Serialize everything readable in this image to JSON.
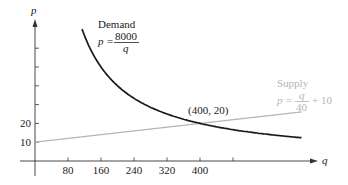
{
  "chart_data": {
    "type": "line",
    "title": "",
    "xlabel": "q",
    "ylabel": "p",
    "x_ticks": [
      80,
      160,
      240,
      320,
      400,
      480
    ],
    "x_tick_labels": [
      "80",
      "160",
      "240",
      "320",
      "400"
    ],
    "y_ticks": [
      10,
      20,
      30,
      40,
      50,
      60
    ],
    "y_tick_labels": [
      "10",
      "20"
    ],
    "xlim": [
      0,
      700
    ],
    "ylim": [
      0,
      75
    ],
    "grid": false,
    "series": [
      {
        "name": "Demand",
        "equation": "p = 8000/q",
        "label_line1": "Demand",
        "label_lhs": "p =",
        "label_num": "8000",
        "label_den": "q",
        "color": "#1a1a1a",
        "q_range": [
          114,
          647
        ],
        "x": [
          114,
          150,
          200,
          250,
          300,
          350,
          400,
          450,
          500,
          550,
          600,
          647
        ],
        "values": [
          70.2,
          53.3,
          40,
          32,
          26.7,
          22.9,
          20,
          17.8,
          16,
          14.5,
          13.3,
          12.4
        ]
      },
      {
        "name": "Supply",
        "equation": "p = q/40 + 10",
        "label_line1": "Supply",
        "label_lhs": "p =",
        "label_num": "q",
        "label_den": "40",
        "label_tail": "+ 10",
        "color": "#b5b5b5",
        "q_range": [
          0,
          647
        ],
        "x": [
          0,
          647
        ],
        "values": [
          10,
          26.2
        ]
      }
    ],
    "annotations": [
      {
        "text": "(400, 20)",
        "x": 400,
        "y": 20
      }
    ]
  }
}
